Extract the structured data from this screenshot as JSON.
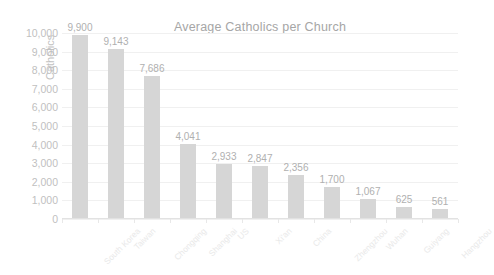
{
  "chart_data": {
    "type": "bar",
    "title": "Average Catholics per Church",
    "xlabel": "",
    "ylabel": "Catholics",
    "ylim": [
      0,
      10000
    ],
    "grid": true,
    "legend": "none",
    "orientation": "vertical",
    "categories": [
      "South Korea",
      "Taiwan",
      "Chongqing",
      "Shanghai",
      "US",
      "Xi'an",
      "China",
      "Zhengzhou",
      "Wuhan",
      "Guiyang",
      "Hangzhou"
    ],
    "values": [
      9900,
      9143,
      7686,
      4041,
      2933,
      2847,
      2356,
      1700,
      1067,
      625,
      561
    ],
    "data_labels": [
      "9,900",
      "9,143",
      "7,686",
      "4,041",
      "2,933",
      "2,847",
      "2,356",
      "1,700",
      "1,067",
      "625",
      "561"
    ],
    "y_ticks": [
      10000,
      9000,
      8000,
      7000,
      6000,
      5000,
      4000,
      3000,
      2000,
      1000,
      0
    ],
    "y_tick_labels": [
      "10,000",
      "9,000",
      "8,000",
      "7,000",
      "6,000",
      "5,000",
      "4,000",
      "3,000",
      "2,000",
      "1,000",
      "0"
    ],
    "colors": {
      "bar": "#d6d6d6",
      "title": "#a6a6a6",
      "tick_label": "#bfbfbf",
      "data_label": "#b0b0b0",
      "axis_title": "#c2c2c2",
      "gridline": "#f0f0f0",
      "category_label": "#e9e9e9",
      "background": "#ffffff"
    }
  }
}
